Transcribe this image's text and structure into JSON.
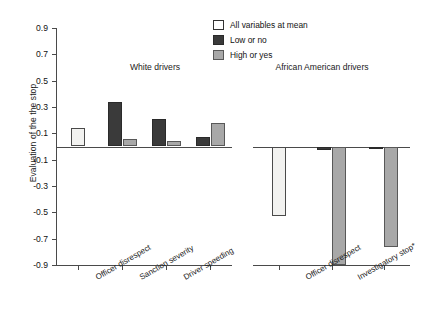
{
  "chart_data": {
    "type": "bar",
    "title": "",
    "xlabel": "",
    "ylabel": "Evaluation of the the stop",
    "ylim": [
      -0.9,
      0.9
    ],
    "yticks": [
      0.9,
      0.7,
      0.5,
      0.3,
      0.1,
      -0.1,
      -0.3,
      -0.5,
      -0.7,
      -0.9
    ],
    "ytick_labels": [
      "0.9",
      "0.7",
      "0.5",
      "0.3",
      "0.1",
      "-0.1",
      "-0.3",
      "-0.5",
      "-0.7",
      "-0.9"
    ],
    "grid": false,
    "legend_position": "top-right",
    "legend": [
      {
        "key": "mean",
        "label": "All variables at mean",
        "color": "#ffffff"
      },
      {
        "key": "low",
        "label": "Low or no",
        "color": "#3a3a3a"
      },
      {
        "key": "high",
        "label": "High or yes",
        "color": "#a8a8a8"
      }
    ],
    "panels": [
      {
        "name": "white-drivers",
        "title": "White drivers",
        "categories": [
          "All variables at mean",
          "Officer disrespect",
          "Sanction severity",
          "Driver speeding"
        ],
        "tick_labels": [
          "",
          "Officer disrespect",
          "Sanction severity",
          "Driver speeding"
        ],
        "groups": [
          {
            "category": "All variables at mean",
            "bars": [
              {
                "series": "mean",
                "value": 0.14
              }
            ]
          },
          {
            "category": "Officer disrespect",
            "bars": [
              {
                "series": "low",
                "value": 0.34
              },
              {
                "series": "high",
                "value": 0.06
              }
            ]
          },
          {
            "category": "Sanction severity",
            "bars": [
              {
                "series": "low",
                "value": 0.21
              },
              {
                "series": "high",
                "value": 0.04
              }
            ]
          },
          {
            "category": "Driver speeding",
            "bars": [
              {
                "series": "low",
                "value": 0.07
              },
              {
                "series": "high",
                "value": 0.18
              }
            ]
          }
        ]
      },
      {
        "name": "african-american-drivers",
        "title": "African American drivers",
        "categories": [
          "All variables at mean",
          "Officer disrespect",
          "Investigatory stop*"
        ],
        "tick_labels": [
          "",
          "Officer disrespect",
          "Investigatory stop*"
        ],
        "groups": [
          {
            "category": "All variables at mean",
            "bars": [
              {
                "series": "mean",
                "value": -0.53
              }
            ]
          },
          {
            "category": "Officer disrespect",
            "bars": [
              {
                "series": "low",
                "value": -0.03
              },
              {
                "series": "high",
                "value": -0.9
              }
            ]
          },
          {
            "category": "Investigatory stop*",
            "bars": [
              {
                "series": "low",
                "value": -0.02
              },
              {
                "series": "high",
                "value": -0.76
              }
            ]
          }
        ]
      }
    ]
  }
}
